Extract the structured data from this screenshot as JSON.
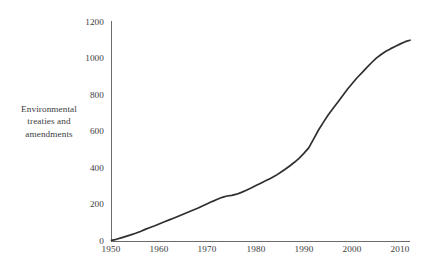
{
  "figure": {
    "name": "environmental-treaties-line-chart",
    "background_color": "#ffffff",
    "text_color": "#3c3c3c",
    "line_color": "#2f2f2f",
    "axis_color": "#6b6b6b"
  },
  "axis": {
    "y_label_lines": [
      "Environmental",
      "treaties and",
      "amendments"
    ],
    "y_ticks": [
      "0",
      "200",
      "400",
      "600",
      "800",
      "1000",
      "1200"
    ],
    "x_ticks": [
      "1950",
      "1960",
      "1970",
      "1980",
      "1990",
      "2000",
      "2010"
    ]
  },
  "chart_data": {
    "type": "line",
    "title": "",
    "xlabel": "",
    "ylabel": "Environmental treaties and amendments",
    "xlim": [
      1950,
      2012
    ],
    "ylim": [
      0,
      1200
    ],
    "xticks": [
      1950,
      1960,
      1970,
      1980,
      1990,
      2000,
      2010
    ],
    "yticks": [
      0,
      200,
      400,
      600,
      800,
      1000,
      1200
    ],
    "grid": false,
    "legend": "none",
    "series": [
      {
        "name": "Environmental treaties and amendments",
        "color": "#2f2f2f",
        "x": [
          1950,
          1951,
          1952,
          1953,
          1954,
          1955,
          1956,
          1957,
          1958,
          1959,
          1960,
          1961,
          1962,
          1963,
          1964,
          1965,
          1966,
          1967,
          1968,
          1969,
          1970,
          1971,
          1972,
          1973,
          1974,
          1975,
          1976,
          1977,
          1978,
          1979,
          1980,
          1981,
          1982,
          1983,
          1984,
          1985,
          1986,
          1987,
          1988,
          1989,
          1990,
          1991,
          1992,
          1993,
          1994,
          1995,
          1996,
          1997,
          1998,
          1999,
          2000,
          2001,
          2002,
          2003,
          2004,
          2005,
          2006,
          2007,
          2008,
          2009,
          2010,
          2011,
          2012
        ],
        "values": [
          6,
          12,
          20,
          28,
          36,
          45,
          55,
          66,
          76,
          86,
          97,
          108,
          118,
          128,
          139,
          150,
          161,
          172,
          183,
          195,
          207,
          219,
          230,
          241,
          248,
          252,
          258,
          268,
          280,
          292,
          305,
          318,
          331,
          344,
          358,
          375,
          393,
          412,
          432,
          455,
          482,
          512,
          560,
          608,
          650,
          690,
          725,
          760,
          795,
          830,
          862,
          893,
          920,
          948,
          975,
          1000,
          1020,
          1038,
          1052,
          1065,
          1078,
          1090,
          1098
        ]
      }
    ]
  }
}
